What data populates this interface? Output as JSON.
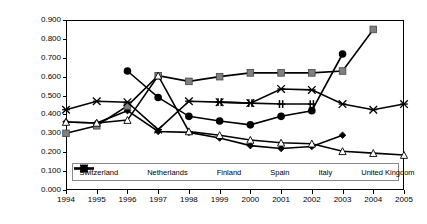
{
  "chart_data": {
    "type": "line",
    "title": "",
    "xlabel": "",
    "ylabel": "Normalized differentiation index",
    "x": [
      1994,
      1995,
      1996,
      1997,
      1998,
      1999,
      2000,
      2001,
      2002,
      2003,
      2004,
      2005
    ],
    "xticklabels": [
      "1994",
      "1995",
      "1996",
      "1997",
      "1998",
      "1999",
      "2000",
      "2001",
      "2002",
      "2003",
      "2004",
      "2005"
    ],
    "yticklabels": [
      "0.000",
      "0.100",
      "0.200",
      "0.300",
      "0.400",
      "0.500",
      "0.600",
      "0.700",
      "0.800",
      "0.900"
    ],
    "yticks": [
      0.0,
      0.1,
      0.2,
      0.3,
      0.4,
      0.5,
      0.6,
      0.7,
      0.8,
      0.9
    ],
    "ylim": [
      0.0,
      0.9
    ],
    "xlim": [
      1994,
      2005
    ],
    "grid": "horizontal",
    "legend_position": "bottom-inside",
    "series": [
      {
        "name": "Switzerland",
        "marker": "diamond",
        "values": [
          0.36,
          0.355,
          0.42,
          0.31,
          0.305,
          0.275,
          0.235,
          0.22,
          0.23,
          0.29,
          null,
          null
        ]
      },
      {
        "name": "Netherlands",
        "marker": "square",
        "values": [
          0.3,
          0.34,
          0.445,
          0.605,
          0.575,
          0.6,
          0.62,
          0.62,
          0.62,
          0.63,
          0.85,
          null
        ]
      },
      {
        "name": "Finland",
        "marker": "triangle-open",
        "values": [
          0.36,
          0.355,
          0.37,
          0.605,
          0.31,
          0.29,
          0.265,
          0.25,
          0.245,
          0.205,
          0.195,
          0.185
        ]
      },
      {
        "name": "Spain",
        "marker": "plus",
        "values": [
          null,
          null,
          null,
          null,
          null,
          0.465,
          0.46,
          0.455,
          0.455,
          null,
          null,
          null
        ]
      },
      {
        "name": "Italy",
        "marker": "cross",
        "values": [
          0.425,
          0.47,
          0.465,
          0.32,
          0.47,
          0.465,
          0.46,
          0.535,
          0.53,
          0.455,
          0.425,
          0.455
        ]
      },
      {
        "name": "United Kingdom",
        "marker": "circle",
        "values": [
          null,
          null,
          0.63,
          0.49,
          0.39,
          0.365,
          0.345,
          0.39,
          0.42,
          0.72,
          null,
          null
        ]
      }
    ],
    "series_color": "#000000",
    "netherlands_marker_color": "#808080",
    "gridline_color": "#9a9a9a"
  },
  "legend": {
    "items": [
      {
        "label": "Switzerland",
        "marker": "diamond"
      },
      {
        "label": "Netherlands",
        "marker": "square"
      },
      {
        "label": "Finland",
        "marker": "triangle-open"
      },
      {
        "label": "Spain",
        "marker": "plus"
      },
      {
        "label": "Italy",
        "marker": "cross"
      },
      {
        "label": "United Kingdom",
        "marker": "circle"
      }
    ]
  }
}
